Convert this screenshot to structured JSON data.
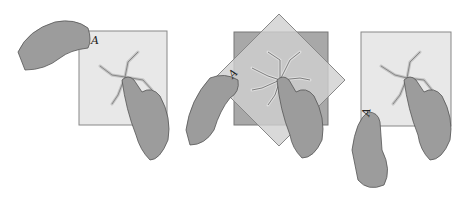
{
  "figure": {
    "panels": [
      {
        "label": "A",
        "description": "hand lifting corner A of sheet; other hand holds pattern"
      },
      {
        "label": "A",
        "description": "sheet rotated diagonally over square, pattern held in center"
      },
      {
        "label": "A",
        "description": "sheet back in place, corner A at lower left held by hand"
      }
    ]
  },
  "colors": {
    "paper": "#e6e6e6",
    "paper_dark": "#a8a8a8",
    "overlay": "#c8c8c8",
    "hand": "#9a9a9a",
    "outline": "#555555"
  }
}
